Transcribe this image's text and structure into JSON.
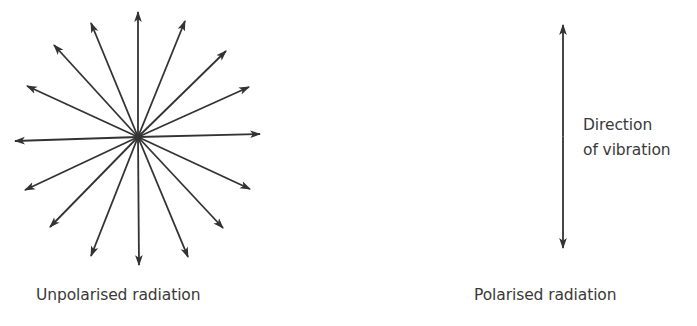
{
  "figure": {
    "unpolarised": {
      "caption": "Unpolarised radiation",
      "center": [
        138,
        137
      ],
      "arrow_tips": [
        [
          138,
          12
        ],
        [
          185,
          21
        ],
        [
          226,
          51
        ],
        [
          249,
          87
        ],
        [
          260,
          134
        ],
        [
          250,
          189
        ],
        [
          223,
          228
        ],
        [
          188,
          257
        ],
        [
          139,
          265
        ],
        [
          91,
          256
        ],
        [
          50,
          227
        ],
        [
          25,
          190
        ],
        [
          15,
          141
        ],
        [
          27,
          86
        ],
        [
          54,
          45
        ],
        [
          91,
          23
        ]
      ]
    },
    "polarised": {
      "caption": "Polarised radiation",
      "arrow": {
        "x": 563,
        "top": 25,
        "bottom": 248
      },
      "annotation_line1": "Direction",
      "annotation_line2": "of vibration"
    },
    "colors": {
      "arrow": "#333333",
      "text": "#3a3a3a",
      "background": "#ffffff"
    }
  }
}
